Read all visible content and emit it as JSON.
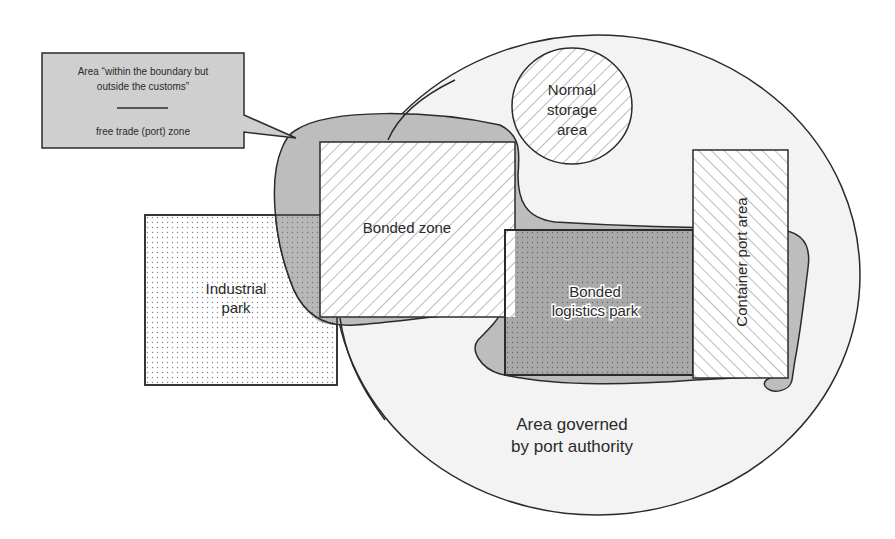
{
  "diagram": {
    "callout": {
      "line1": "Area “within the boundary but",
      "line2": "outside the customs”",
      "line3": "free trade (port) zone"
    },
    "regions": {
      "normal_storage": {
        "line1": "Normal",
        "line2": "storage",
        "line3": "area"
      },
      "bonded_zone": {
        "label": "Bonded zone"
      },
      "industrial_park": {
        "line1": "Industrial",
        "line2": "park"
      },
      "bonded_logistics_park": {
        "line1": "Bonded",
        "line2": "logistics park"
      },
      "container_port_area": {
        "label": "Container port area"
      },
      "port_authority_area": {
        "line1": "Area governed",
        "line2": "by port authority"
      }
    },
    "colors": {
      "stroke": "#2b2b2b",
      "free_trade_gray": "#bdbdbd",
      "circle_fill": "#f3f3f3",
      "callout_fill": "#cfcfcf",
      "logistics_fill": "#a9a9a9"
    }
  }
}
